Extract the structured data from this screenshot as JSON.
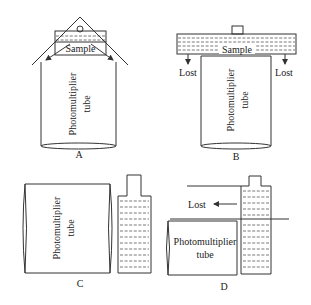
{
  "diagram": {
    "type": "scintillation-counting geometries",
    "panels": [
      {
        "id": "A",
        "label": "A",
        "tube_label_line1": "Photomultiplier",
        "tube_label_line2": "tube",
        "sample_label": "Sample"
      },
      {
        "id": "B",
        "label": "B",
        "tube_label_line1": "Photomultiplier",
        "tube_label_line2": "tube",
        "sample_label": "Sample",
        "lost_left": "Lost",
        "lost_right": "Lost"
      },
      {
        "id": "C",
        "label": "C",
        "tube_label_line1": "Photomultiplier",
        "tube_label_line2": "tube"
      },
      {
        "id": "D",
        "label": "D",
        "tube_label_line1": "Photomultiplier",
        "tube_label_line2": "tube",
        "lost": "Lost"
      }
    ],
    "colors": {
      "line": "#333333",
      "text": "#222222",
      "background": "#ffffff"
    }
  }
}
